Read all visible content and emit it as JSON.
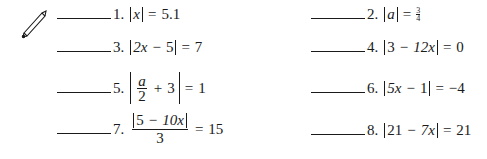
{
  "icon": "pencil-icon",
  "problems": [
    {
      "number": "1.",
      "lhs": "x",
      "rhs": "5.1"
    },
    {
      "number": "2.",
      "lhs": "a",
      "rhs_num": "3",
      "rhs_den": "4"
    },
    {
      "number": "3.",
      "lhs_a": "2x",
      "lhs_op": "−",
      "lhs_b": "5",
      "rhs": "7"
    },
    {
      "number": "4.",
      "lhs_a": "3",
      "lhs_op": "−",
      "lhs_b": "12x",
      "rhs": "0"
    },
    {
      "number": "5.",
      "frac_num": "a",
      "frac_den": "2",
      "lhs_op": "+",
      "lhs_b": "3",
      "rhs": "1"
    },
    {
      "number": "6.",
      "lhs_a": "5x",
      "lhs_op": "−",
      "lhs_b": "1",
      "rhs": "−4"
    },
    {
      "number": "7.",
      "num_a": "5",
      "num_op": "−",
      "num_b": "10x",
      "den": "3",
      "rhs": "15"
    },
    {
      "number": "8.",
      "lhs_a": "21",
      "lhs_op": "−",
      "lhs_b": "7x",
      "rhs": "21"
    }
  ],
  "equals": "="
}
